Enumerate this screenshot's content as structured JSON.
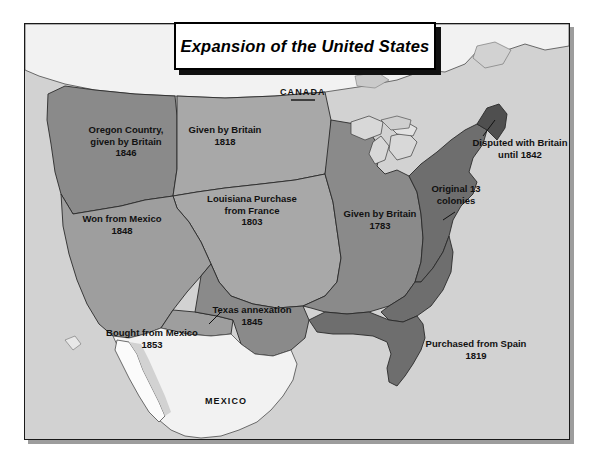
{
  "title": {
    "text": "Expansion of the United States"
  },
  "country_labels": [
    {
      "name": "canada",
      "text": "CANADA"
    },
    {
      "name": "mexico",
      "text": "MEXICO"
    }
  ],
  "territories": [
    {
      "name": "oregon-country",
      "lines": [
        "Oregon Country,",
        "given by Britain",
        "1846"
      ],
      "color": "#8a8a8a"
    },
    {
      "name": "given-by-britain-1818",
      "lines": [
        "Given by Britain",
        "1818"
      ],
      "color": "#a8a8a8"
    },
    {
      "name": "louisiana-purchase",
      "lines": [
        "Louisiana Purchase",
        "from France",
        "1803"
      ],
      "color": "#a8a8a8"
    },
    {
      "name": "mexican-cession",
      "lines": [
        "Won from Mexico",
        "1848"
      ],
      "color": "#9e9e9e"
    },
    {
      "name": "texas-annexation",
      "lines": [
        "Texas annexation",
        "1845"
      ],
      "color": "#8a8a8a"
    },
    {
      "name": "gadsden-purchase",
      "lines": [
        "Bought from Mexico",
        "1853"
      ],
      "color": "#9e9e9e"
    },
    {
      "name": "given-by-britain-1783",
      "lines": [
        "Given by Britain",
        "1783"
      ],
      "color": "#8a8a8a"
    },
    {
      "name": "original-13-colonies",
      "lines": [
        "Original 13",
        "colonies"
      ],
      "color": "#6e6e6e"
    },
    {
      "name": "disputed-with-britain",
      "lines": [
        "Disputed with Britain",
        "until 1842"
      ],
      "color": "#4f4f4f"
    },
    {
      "name": "florida-purchase",
      "lines": [
        "Purchased from Spain",
        "1819"
      ],
      "color": "#6e6e6e"
    }
  ],
  "colors": {
    "page_background": "#ffffff",
    "map_background": "#d2d2d2",
    "land_outside": "#f2f2f2",
    "water": "#d2d2d2",
    "frame": "#1a1a1a",
    "label_text": "#111111"
  }
}
